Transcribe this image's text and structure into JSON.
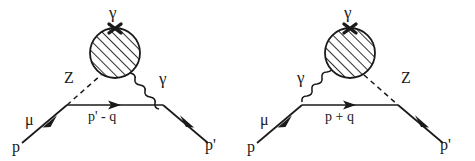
{
  "figure": {
    "type": "feynman-diagram-pair",
    "background_color": "#ffffff",
    "line_color": "#1a1a1a"
  },
  "diagrams": [
    {
      "id": "left",
      "name": "Z-gamma exchange diagram (Z on incoming side)",
      "labels": {
        "external_photon": "γ",
        "incoming_fermion": "μ",
        "incoming_momentum": "p",
        "outgoing_momentum": "p'",
        "internal_momentum": "p' - q",
        "left_boson": "Z",
        "right_boson": "γ"
      },
      "elements": {
        "blob": "hatched-circle",
        "cross_mark": "×",
        "left_boson_style": "dashed",
        "right_boson_style": "wavy"
      }
    },
    {
      "id": "right",
      "name": "gamma-Z exchange diagram (gamma on incoming side)",
      "labels": {
        "external_photon": "γ",
        "incoming_fermion": "μ",
        "incoming_momentum": "p",
        "outgoing_momentum": "p'",
        "internal_momentum": "p + q",
        "left_boson": "γ",
        "right_boson": "Z"
      },
      "elements": {
        "blob": "hatched-circle",
        "cross_mark": "×",
        "left_boson_style": "wavy",
        "right_boson_style": "dashed"
      }
    }
  ]
}
